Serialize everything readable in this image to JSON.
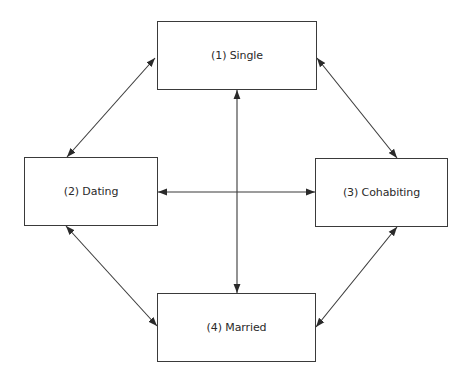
{
  "diagram": {
    "type": "state-transition",
    "nodes": [
      {
        "id": "single",
        "label": "(1) Single"
      },
      {
        "id": "dating",
        "label": "(2) Dating"
      },
      {
        "id": "cohabiting",
        "label": "(3) Cohabiting"
      },
      {
        "id": "married",
        "label": "(4) Married"
      }
    ],
    "edges": [
      {
        "from": "single",
        "to": "dating",
        "bidirectional": true
      },
      {
        "from": "single",
        "to": "cohabiting",
        "bidirectional": true
      },
      {
        "from": "single",
        "to": "married",
        "bidirectional": true
      },
      {
        "from": "dating",
        "to": "cohabiting",
        "bidirectional": true
      },
      {
        "from": "dating",
        "to": "married",
        "bidirectional": true
      },
      {
        "from": "cohabiting",
        "to": "married",
        "bidirectional": true
      }
    ],
    "colors": {
      "stroke": "#3a3a3a",
      "background": "#ffffff",
      "text": "#2a2a2a"
    }
  }
}
